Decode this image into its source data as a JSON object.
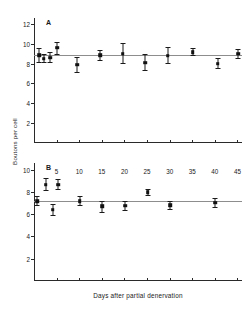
{
  "figure": {
    "ylabel": "Boutons per cell",
    "xlabel": "Days after partial denervation",
    "line_color": "#8d8d8d",
    "marker_color": "#111111",
    "axis_color": "#2a2a2a"
  },
  "chart_data": [
    {
      "type": "scatter",
      "panel": "A",
      "title": "",
      "xlabel": "",
      "ylabel": "Boutons per cell",
      "xlim": [
        0,
        46
      ],
      "ylim": [
        0,
        12.6
      ],
      "yticks": [
        2,
        4,
        6,
        8,
        10,
        12
      ],
      "xticks": [
        5,
        10,
        15,
        20,
        25,
        30,
        35,
        40,
        45
      ],
      "xticklabels": [
        "",
        "",
        "",
        "",
        "",
        "",
        "",
        "",
        ""
      ],
      "grid": false,
      "legend": "none",
      "reference_line": 8.85,
      "x": [
        1,
        2,
        3.5,
        5,
        9.5,
        14.5,
        19.5,
        24.5,
        29.5,
        35,
        40.5,
        45
      ],
      "y": [
        8.85,
        8.5,
        8.6,
        9.6,
        7.9,
        8.85,
        9.0,
        8.1,
        8.8,
        9.15,
        8.0,
        9.0
      ],
      "yerr_low": [
        0.75,
        0.45,
        0.55,
        0.75,
        0.85,
        0.55,
        1.0,
        0.8,
        0.8,
        0.4,
        0.55,
        0.5
      ],
      "yerr_high": [
        0.75,
        0.45,
        0.55,
        0.6,
        0.75,
        0.55,
        1.05,
        0.85,
        0.9,
        0.45,
        0.55,
        0.5
      ],
      "n_points": 12
    },
    {
      "type": "scatter",
      "panel": "B",
      "title": "",
      "xlabel": "Days after partial denervation",
      "ylabel": "Boutons per cell",
      "xlim": [
        0,
        46
      ],
      "ylim": [
        0,
        10.6
      ],
      "yticks": [
        2,
        4,
        6,
        8,
        10
      ],
      "xticks": [
        5,
        10,
        15,
        20,
        25,
        30,
        35,
        40,
        45
      ],
      "xticklabels": [
        "5",
        "10",
        "15",
        "20",
        "25",
        "30",
        "35",
        "40",
        "45"
      ],
      "grid": false,
      "legend": "none",
      "reference_line": 7.15,
      "x": [
        0.6,
        2.5,
        4.0,
        5.2,
        10,
        15,
        20,
        25,
        30,
        40
      ],
      "y": [
        7.15,
        8.65,
        6.4,
        8.65,
        7.15,
        6.7,
        6.75,
        7.95,
        6.8,
        7.05
      ],
      "yerr_low": [
        0.45,
        0.6,
        0.55,
        0.5,
        0.45,
        0.55,
        0.45,
        0.35,
        0.4,
        0.45
      ],
      "yerr_high": [
        0.45,
        0.6,
        0.55,
        0.5,
        0.45,
        0.5,
        0.45,
        0.35,
        0.4,
        0.45
      ],
      "n_points": 10
    }
  ],
  "panels": {
    "a": {
      "tag": "A"
    },
    "b": {
      "tag": "B"
    }
  }
}
